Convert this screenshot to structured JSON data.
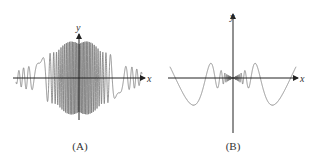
{
  "figure": {
    "panels": [
      {
        "id": "A",
        "caption": "(A)",
        "x_label": "x",
        "y_label": "y",
        "description": "Rapidly oscillating function with a Gaussian-like envelope, maximal amplitude near x=0, decaying and slower oscillations toward the edges"
      },
      {
        "id": "B",
        "caption": "(B)",
        "x_label": "x",
        "y_label": "y",
        "description": "Function oscillating rapidly with amplitude shrinking to zero at x=0 (bow-tie shape), with slower large oscillations farther from the origin"
      }
    ]
  },
  "colors": {
    "axis": "#222222",
    "curve": "#777777",
    "background": "#ffffff"
  }
}
